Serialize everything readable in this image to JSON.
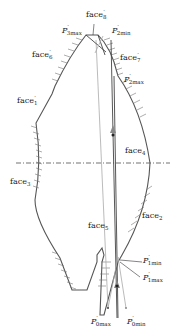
{
  "diagram": {
    "type": "optical-face-ray-diagram",
    "colors": {
      "outline": "#555555",
      "ray": "#444444",
      "ray_light": "#aaaaaa",
      "axis": "#333333"
    },
    "face_labels": {
      "face8p": {
        "base": "face",
        "sub": "8",
        "prime": "′"
      },
      "face6p": {
        "base": "face",
        "sub": "6",
        "prime": "′"
      },
      "face7p": {
        "base": "face",
        "sub": "7",
        "prime": "′"
      },
      "face1p": {
        "base": "face",
        "sub": "1",
        "prime": "′"
      },
      "face4": {
        "base": "face",
        "sub": "4"
      },
      "face3": {
        "base": "face",
        "sub": "3"
      },
      "face5": {
        "base": "face",
        "sub": "5"
      },
      "face2": {
        "base": "face",
        "sub": "2"
      }
    },
    "point_labels": {
      "p3max": {
        "base": "P",
        "prime": "′",
        "sub": "3max"
      },
      "p2min": {
        "base": "P",
        "prime": "′",
        "sub": "2min"
      },
      "p2max": {
        "base": "P",
        "prime": "′",
        "sub": "2max"
      },
      "p1min": {
        "base": "P",
        "prime": "′",
        "sub": "1min"
      },
      "p1max": {
        "base": "P",
        "prime": "′",
        "sub": "1max"
      },
      "p0max": {
        "base": "P",
        "prime": "′",
        "sub": "0max"
      },
      "p0min": {
        "base": "P",
        "prime": "′",
        "sub": "0min"
      }
    }
  }
}
